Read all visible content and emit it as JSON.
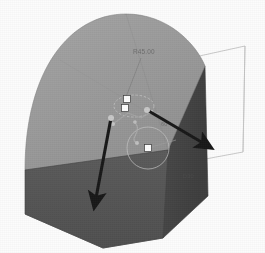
{
  "app": {
    "kind": "cad-3d-modeling-viewport",
    "title": "3D Solid Model Viewport",
    "background_color": "#ffffff"
  },
  "model": {
    "name": "arched-block-solid",
    "description": "Isometric extruded block with rounded (arched) top face",
    "faces": {
      "top_face_color": "#9a9a9a",
      "front_left_face_color": "#4f4f4f",
      "right_side_face_color": "#3e3e3e",
      "bottom_face_color": "#565656",
      "edge_color": "#6a6a6a"
    }
  },
  "sketch": {
    "name": "active-sketch-overlay",
    "circle_label": "circle-entity",
    "ellipse_label": "ellipse-entity",
    "line_color": "#8d8d8d",
    "handle_color": "#ffffff",
    "handle_border_color": "#3a3a3a",
    "handles": [
      {
        "name": "handle-upper",
        "x": 127,
        "y": 99
      },
      {
        "name": "handle-mid",
        "x": 125,
        "y": 108
      },
      {
        "name": "handle-circle-center",
        "x": 148,
        "y": 148
      }
    ]
  },
  "annotations": {
    "dimension_top": "R45.00",
    "dimension_mid": "60",
    "dimension_lower_right": "D30"
  },
  "manipulators": {
    "arrow_left": {
      "name": "extrude-direction-arrow-left",
      "color": "#111111",
      "from_x": 110,
      "from_y": 118,
      "to_x": 95,
      "to_y": 205
    },
    "arrow_right": {
      "name": "extrude-direction-arrow-right",
      "color": "#111111",
      "from_x": 147,
      "from_y": 110,
      "to_x": 208,
      "to_y": 145
    }
  },
  "preview": {
    "name": "wireframe-preview-outline",
    "color": "#b9b9b9",
    "description": "Thin unshaded wireframe extension on right side"
  }
}
